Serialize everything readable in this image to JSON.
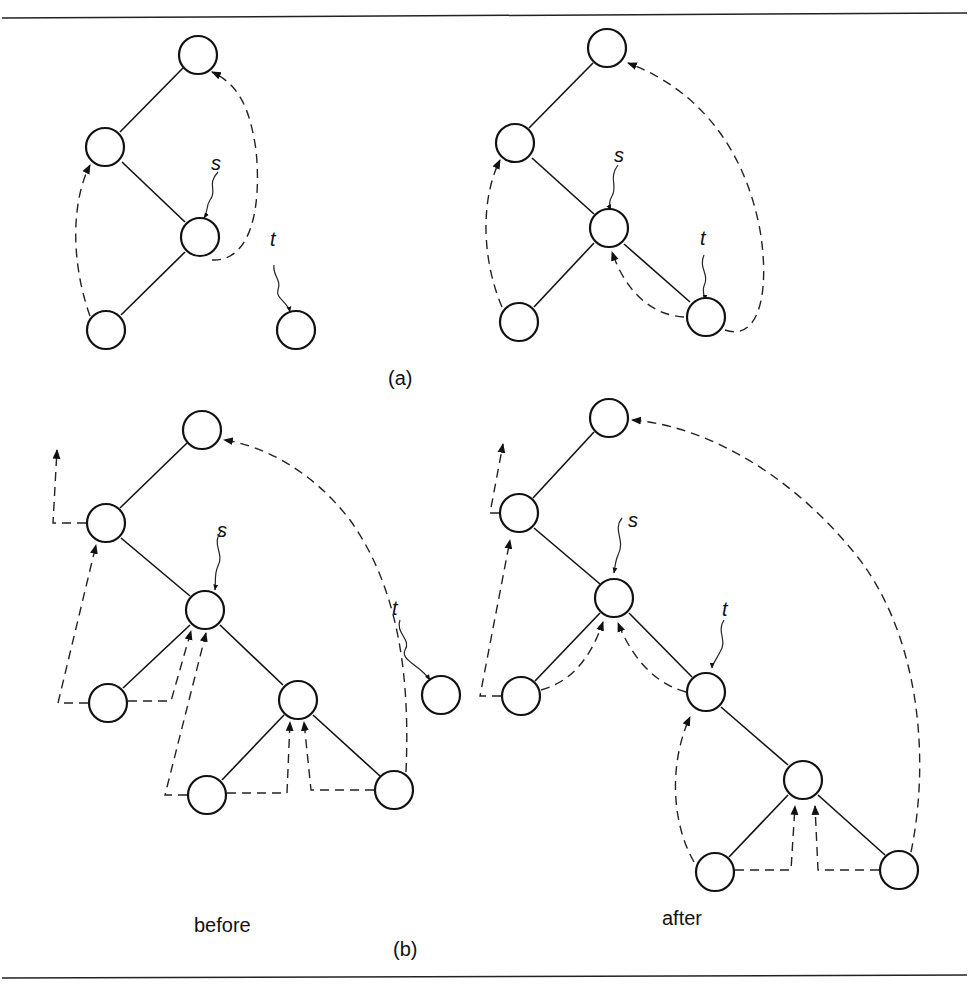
{
  "figure": {
    "panel_a": {
      "label": "(a)",
      "before": {
        "pointer_s": "s",
        "pointer_t": "t"
      },
      "after": {
        "pointer_s": "s",
        "pointer_t": "t"
      }
    },
    "panel_b": {
      "label": "(b)",
      "before": {
        "caption": "before",
        "pointer_s": "s",
        "pointer_t": "t"
      },
      "after": {
        "caption": "after",
        "pointer_s": "s",
        "pointer_t": "t"
      }
    }
  }
}
